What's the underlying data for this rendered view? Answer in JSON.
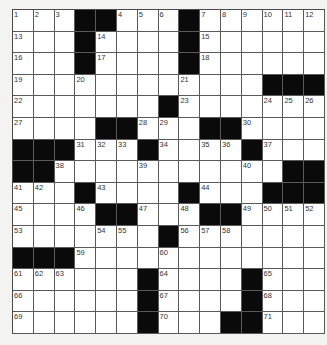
{
  "puzzle": {
    "rows": 15,
    "cols": 15,
    "colors": {
      "block": "#0a0a0a",
      "cell": "#ffffff",
      "line": "#5a5a5a",
      "background": "#f3f3f1"
    },
    "grid": [
      [
        1,
        2,
        3,
        "#",
        "#",
        4,
        5,
        6,
        "#",
        7,
        8,
        9,
        10,
        11,
        12
      ],
      [
        13,
        0,
        0,
        "#",
        14,
        0,
        0,
        0,
        "#",
        15,
        0,
        0,
        0,
        0,
        0
      ],
      [
        16,
        0,
        0,
        "#",
        17,
        0,
        0,
        0,
        "#",
        18,
        0,
        0,
        0,
        0,
        0
      ],
      [
        19,
        0,
        0,
        20,
        0,
        0,
        0,
        0,
        21,
        0,
        0,
        0,
        "#",
        "#",
        "#"
      ],
      [
        22,
        0,
        0,
        0,
        0,
        0,
        0,
        "#",
        23,
        0,
        0,
        0,
        24,
        25,
        26
      ],
      [
        27,
        0,
        0,
        0,
        "#",
        "#",
        28,
        29,
        0,
        "#",
        "#",
        30,
        0,
        0,
        0
      ],
      [
        "#",
        "#",
        "#",
        31,
        32,
        33,
        "#",
        34,
        0,
        35,
        36,
        "#",
        37,
        0,
        0
      ],
      [
        "#",
        "#",
        38,
        0,
        0,
        0,
        39,
        0,
        0,
        0,
        0,
        40,
        0,
        "#",
        "#"
      ],
      [
        41,
        42,
        0,
        "#",
        43,
        0,
        0,
        0,
        "#",
        44,
        0,
        0,
        "#",
        "#",
        "#"
      ],
      [
        45,
        0,
        0,
        46,
        "#",
        "#",
        47,
        0,
        48,
        "#",
        "#",
        49,
        50,
        51,
        52
      ],
      [
        53,
        0,
        0,
        0,
        54,
        55,
        0,
        "#",
        56,
        57,
        58,
        0,
        0,
        0,
        0
      ],
      [
        "#",
        "#",
        "#",
        59,
        0,
        0,
        0,
        60,
        0,
        0,
        0,
        0,
        0,
        0,
        0
      ],
      [
        61,
        62,
        63,
        0,
        0,
        0,
        "#",
        64,
        0,
        0,
        0,
        "#",
        65,
        0,
        0
      ],
      [
        66,
        0,
        0,
        0,
        0,
        0,
        "#",
        67,
        0,
        0,
        0,
        "#",
        68,
        0,
        0
      ],
      [
        69,
        0,
        0,
        0,
        0,
        0,
        "#",
        70,
        0,
        0,
        "#",
        "#",
        71,
        0,
        0
      ]
    ],
    "entries": {}
  }
}
